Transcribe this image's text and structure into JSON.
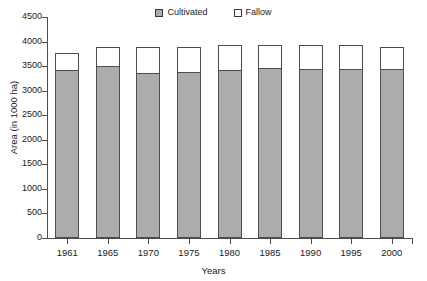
{
  "chart_data": {
    "type": "bar",
    "subtype": "stacked-vertical",
    "title": "",
    "xlabel": "Years",
    "ylabel": "Area (in 1000 ha)",
    "categories": [
      "1961",
      "1965",
      "1970",
      "1975",
      "1980",
      "1985",
      "1990",
      "1995",
      "2000"
    ],
    "series": [
      {
        "name": "Cultivated",
        "color": "#ACACAC",
        "values": [
          3430,
          3500,
          3370,
          3390,
          3430,
          3460,
          3450,
          3450,
          3440
        ]
      },
      {
        "name": "Fallow",
        "color": "#FFFFFF",
        "values": [
          350,
          410,
          540,
          520,
          530,
          500,
          510,
          500,
          460
        ]
      }
    ],
    "totals": [
      3780,
      3910,
      3910,
      3910,
      3960,
      3960,
      3960,
      3950,
      3900
    ],
    "ylim": [
      0,
      4500
    ],
    "ytick_step": 500,
    "yticks": [
      "0",
      "500",
      "1000",
      "1500",
      "2000",
      "2500",
      "3000",
      "3500",
      "4000",
      "4500"
    ],
    "grid": false,
    "legend_position": "top-center",
    "legend": [
      "Cultivated",
      "Fallow"
    ]
  },
  "legend": {
    "cultivated_label": "Cultivated",
    "fallow_label": "Fallow"
  },
  "axes": {
    "y_title": "Area (in 1000 ha)",
    "x_title": "Years"
  }
}
